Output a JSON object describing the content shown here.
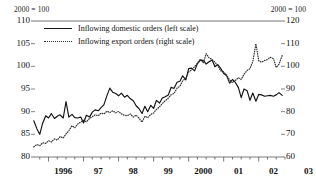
{
  "chart_data": {
    "type": "line",
    "title": "",
    "subtitle": "",
    "unit_note_left": "2000 = 100",
    "unit_note_right": "2000 = 100",
    "xlabel": "",
    "ylabel_left": "",
    "ylabel_right": "",
    "x_tick_labels": [
      "1996",
      "97",
      "98",
      "99",
      "2000",
      "01",
      "02",
      "03"
    ],
    "x_tick_values": [
      1996,
      1997,
      1998,
      1999,
      2000,
      2001,
      2002,
      2003
    ],
    "xlim": [
      1995.5,
      2002.75
    ],
    "ylim_left": [
      80,
      110
    ],
    "ylim_right": [
      60,
      120
    ],
    "y_ticks_left": [
      80,
      85,
      90,
      95,
      100,
      105,
      110
    ],
    "y_ticks_right": [
      60,
      70,
      80,
      90,
      100,
      110,
      120
    ],
    "grid": false,
    "legend_position": "top-left",
    "legend": [
      {
        "label": "Inflowing domestic orders (left scale)",
        "style": "solid",
        "axis": "left"
      },
      {
        "label": "Inflowing export orders (right scale)",
        "style": "dotted",
        "axis": "right"
      }
    ],
    "series": [
      {
        "name": "Inflowing domestic orders (left scale)",
        "axis": "left",
        "style": "solid",
        "color": "#111111",
        "x": [
          1995.58,
          1995.67,
          1995.75,
          1995.83,
          1995.92,
          1996.0,
          1996.08,
          1996.17,
          1996.25,
          1996.33,
          1996.42,
          1996.5,
          1996.58,
          1996.67,
          1996.75,
          1996.83,
          1996.92,
          1997.0,
          1997.08,
          1997.17,
          1997.25,
          1997.33,
          1997.42,
          1997.5,
          1997.58,
          1997.67,
          1997.75,
          1997.83,
          1997.92,
          1998.0,
          1998.08,
          1998.17,
          1998.25,
          1998.33,
          1998.42,
          1998.5,
          1998.58,
          1998.67,
          1998.75,
          1998.83,
          1998.92,
          1999.0,
          1999.08,
          1999.17,
          1999.25,
          1999.33,
          1999.42,
          1999.5,
          1999.58,
          1999.67,
          1999.75,
          1999.83,
          1999.92,
          2000.0,
          2000.08,
          2000.17,
          2000.25,
          2000.33,
          2000.42,
          2000.5,
          2000.58,
          2000.67,
          2000.75,
          2000.83,
          2000.92,
          2001.0,
          2001.08,
          2001.17,
          2001.25,
          2001.33,
          2001.42,
          2001.5,
          2001.58,
          2001.67,
          2001.75,
          2001.83,
          2001.92,
          2002.0,
          2002.08,
          2002.17,
          2002.25,
          2002.33,
          2002.42,
          2002.5,
          2002.58,
          2002.67
        ],
        "values": [
          88.0,
          86.2,
          85.0,
          87.4,
          89.1,
          88.6,
          89.6,
          88.5,
          89.0,
          89.3,
          88.6,
          92.2,
          88.8,
          89.4,
          88.7,
          88.6,
          88.8,
          87.5,
          89.2,
          88.8,
          89.9,
          90.4,
          90.2,
          90.9,
          91.5,
          93.6,
          95.2,
          94.3,
          94.0,
          93.5,
          94.1,
          93.2,
          93.6,
          92.9,
          92.4,
          91.3,
          90.7,
          89.6,
          91.2,
          90.0,
          91.4,
          90.7,
          92.5,
          91.9,
          93.0,
          93.3,
          93.7,
          95.4,
          95.1,
          96.5,
          96.7,
          97.9,
          97.0,
          99.5,
          99.6,
          99.0,
          100.6,
          101.3,
          101.3,
          100.5,
          101.0,
          101.4,
          99.9,
          100.4,
          99.5,
          98.4,
          98.0,
          96.3,
          97.1,
          96.5,
          95.3,
          93.1,
          95.0,
          94.6,
          92.5,
          94.1,
          92.3,
          93.8,
          93.7,
          93.4,
          93.5,
          93.6,
          93.4,
          93.7,
          94.2,
          93.6
        ]
      },
      {
        "name": "Inflowing export orders (right scale)",
        "axis": "right",
        "style": "dotted",
        "color": "#333333",
        "x": [
          1995.58,
          1995.67,
          1995.75,
          1995.83,
          1995.92,
          1996.0,
          1996.08,
          1996.17,
          1996.25,
          1996.33,
          1996.42,
          1996.5,
          1996.58,
          1996.67,
          1996.75,
          1996.83,
          1996.92,
          1997.0,
          1997.08,
          1997.17,
          1997.25,
          1997.33,
          1997.42,
          1997.5,
          1997.58,
          1997.67,
          1997.75,
          1997.83,
          1997.92,
          1998.0,
          1998.08,
          1998.17,
          1998.25,
          1998.33,
          1998.42,
          1998.5,
          1998.58,
          1998.67,
          1998.75,
          1998.83,
          1998.92,
          1999.0,
          1999.08,
          1999.17,
          1999.25,
          1999.33,
          1999.42,
          1999.5,
          1999.58,
          1999.67,
          1999.75,
          1999.83,
          1999.92,
          2000.0,
          2000.08,
          2000.17,
          2000.25,
          2000.33,
          2000.42,
          2000.5,
          2000.58,
          2000.67,
          2000.75,
          2000.83,
          2000.92,
          2001.0,
          2001.08,
          2001.17,
          2001.25,
          2001.33,
          2001.42,
          2001.5,
          2001.58,
          2001.67,
          2001.75,
          2001.83,
          2001.92,
          2002.0,
          2002.08,
          2002.17,
          2002.25,
          2002.33,
          2002.42,
          2002.5,
          2002.58,
          2002.67
        ],
        "values": [
          64.5,
          65.5,
          65.0,
          66.3,
          66.0,
          67.2,
          66.6,
          68.0,
          67.5,
          69.0,
          68.4,
          70.2,
          71.6,
          73.8,
          72.9,
          74.5,
          75.4,
          76.2,
          75.5,
          77.0,
          77.8,
          78.6,
          78.2,
          79.4,
          79.0,
          80.2,
          79.6,
          80.4,
          79.5,
          80.1,
          79.0,
          78.4,
          78.2,
          79.0,
          77.6,
          78.5,
          77.2,
          75.4,
          78.0,
          77.4,
          78.8,
          79.4,
          81.0,
          82.2,
          83.6,
          84.8,
          86.0,
          87.5,
          88.0,
          90.4,
          91.2,
          93.6,
          94.8,
          97.5,
          98.4,
          99.8,
          101.4,
          103.2,
          101.5,
          105.6,
          103.8,
          103.0,
          101.8,
          100.2,
          98.0,
          97.5,
          96.2,
          94.0,
          92.8,
          93.8,
          95.0,
          94.2,
          96.5,
          98.2,
          99.0,
          102.0,
          110.0,
          102.5,
          101.8,
          102.6,
          103.0,
          104.0,
          103.4,
          99.5,
          101.0,
          104.8
        ]
      }
    ]
  }
}
